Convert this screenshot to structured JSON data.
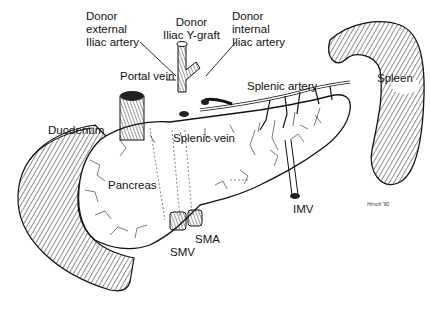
{
  "labels": {
    "donor_external_iliac": [
      "Donor",
      "external",
      "Iliac artery"
    ],
    "donor_iliac_y_graft": [
      "Donor",
      "Iliac Y-graft"
    ],
    "donor_internal_iliac": [
      "Donor",
      "internal",
      "Iliac artery"
    ],
    "portal_vein": "Portal vein",
    "splenic_artery": "Splenic artery",
    "spleen": "Spleen",
    "duodenum": "Duodenum",
    "splenic_vein": "Splenic vein",
    "pancreas": "Pancreas",
    "smv": "SMV",
    "sma": "SMA",
    "imv": "IMV"
  },
  "signature": "Hirsch '90",
  "colors": {
    "ink": "#111111",
    "background": "#ffffff"
  }
}
